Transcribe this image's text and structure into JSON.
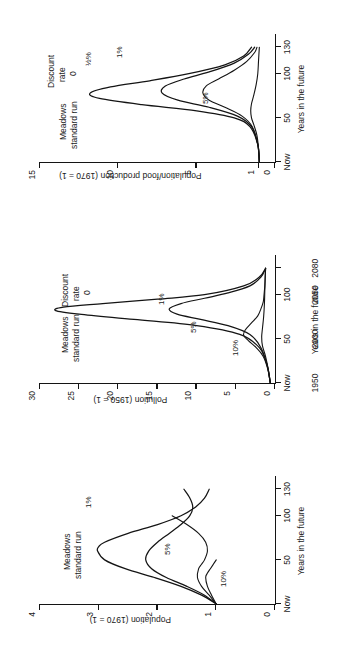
{
  "figure": {
    "shared": {
      "scenario_note_line1": "Meadows",
      "scenario_note_line2": "standard run",
      "legend_line1": "Discount",
      "legend_line2": "rate",
      "legend_line3": "0",
      "xlabel": "Years in the future"
    }
  },
  "chart_data": [
    {
      "id": "population",
      "type": "line",
      "title": "",
      "ylabel": "Population (1970 = 1)",
      "xlabel": "Years in the future",
      "xlim": [
        0,
        145
      ],
      "ylim": [
        0,
        4
      ],
      "yticks": [
        0,
        1,
        2,
        3,
        4
      ],
      "ytick_labels": [
        "0",
        "1",
        "2",
        "3",
        "4"
      ],
      "xticks": [
        0,
        50,
        100,
        130
      ],
      "xtick_labels": [
        "Now",
        "50",
        "100",
        "130"
      ],
      "grid": false,
      "legend_position": "inside-upper-right",
      "annotations": [
        "Meadows standard run",
        "1%",
        "5%",
        "10%"
      ],
      "series": [
        {
          "name": "Discount rate 0",
          "label": "Meadows standard run",
          "x": [
            0,
            10,
            20,
            30,
            40,
            50,
            60,
            65,
            70,
            80,
            90,
            100,
            110,
            120,
            130
          ],
          "values": [
            1.0,
            1.25,
            1.6,
            2.05,
            2.55,
            2.9,
            3.02,
            3.0,
            2.9,
            2.5,
            2.0,
            1.6,
            1.35,
            1.2,
            1.12
          ]
        },
        {
          "name": "1%",
          "label": "1%",
          "x": [
            0,
            10,
            20,
            30,
            40,
            50,
            60,
            70,
            80,
            90,
            100,
            110,
            120,
            130
          ],
          "values": [
            1.0,
            1.2,
            1.5,
            1.85,
            2.1,
            2.2,
            2.15,
            2.0,
            1.8,
            1.6,
            1.45,
            1.4,
            1.45,
            1.55
          ]
        },
        {
          "name": "5%",
          "label": "5%",
          "x": [
            0,
            10,
            20,
            30,
            40,
            45,
            50,
            60,
            70,
            80,
            90,
            100
          ],
          "values": [
            1.0,
            1.12,
            1.25,
            1.32,
            1.3,
            1.25,
            1.2,
            1.15,
            1.18,
            1.3,
            1.5,
            1.75
          ]
        },
        {
          "name": "10%",
          "label": "10%",
          "x": [
            0,
            10,
            20,
            30,
            35,
            40,
            45,
            50
          ],
          "values": [
            1.0,
            1.08,
            1.15,
            1.18,
            1.15,
            1.1,
            1.05,
            1.0
          ]
        }
      ]
    },
    {
      "id": "pollution",
      "type": "line",
      "title": "",
      "ylabel": "Pollution (1950 = 1)",
      "xlabel": "Years in the future",
      "xlim": [
        0,
        145
      ],
      "ylim": [
        0,
        30
      ],
      "yticks": [
        0,
        5,
        10,
        15,
        20,
        25,
        30
      ],
      "ytick_labels": [
        "0",
        "5",
        "10",
        "15",
        "20",
        "25",
        "30"
      ],
      "xticks": [
        0,
        50,
        100,
        130
      ],
      "xtick_labels": [
        "Now",
        "50",
        "100",
        "130"
      ],
      "x_secondary_labels": [
        "1950",
        "2000",
        "2050",
        "2080"
      ],
      "grid": false,
      "legend_position": "inside-upper-right",
      "annotations": [
        "Meadows standard run",
        "Discount rate 0",
        "1%",
        "5%",
        "10%"
      ],
      "series": [
        {
          "name": "Discount rate 0",
          "label": "Meadows standard run",
          "x": [
            0,
            20,
            40,
            55,
            65,
            72,
            78,
            82,
            86,
            90,
            95,
            100,
            110,
            120,
            130
          ],
          "values": [
            0.6,
            1.0,
            2.0,
            4.5,
            10.0,
            18.0,
            25.0,
            28.0,
            27.0,
            22.0,
            15.0,
            9.0,
            4.0,
            2.0,
            1.2
          ]
        },
        {
          "name": "1%",
          "label": "1%",
          "x": [
            0,
            20,
            40,
            55,
            65,
            72,
            78,
            84,
            90,
            96,
            102,
            110,
            120,
            130
          ],
          "values": [
            0.6,
            1.0,
            1.8,
            3.2,
            6.0,
            9.5,
            12.5,
            13.5,
            12.0,
            9.0,
            6.0,
            3.2,
            1.8,
            1.2
          ]
        },
        {
          "name": "5%",
          "label": "5%",
          "x": [
            0,
            15,
            30,
            40,
            48,
            54,
            60,
            68,
            76,
            84,
            92,
            100,
            110,
            120,
            130
          ],
          "values": [
            0.6,
            0.9,
            1.5,
            2.4,
            3.4,
            4.0,
            3.8,
            3.0,
            2.2,
            1.8,
            1.5,
            1.4,
            1.3,
            1.25,
            1.2
          ]
        },
        {
          "name": "10%",
          "label": "10%",
          "x": [
            0,
            15,
            30,
            42,
            52,
            62,
            75,
            90,
            105,
            120,
            130
          ],
          "values": [
            0.6,
            0.85,
            1.2,
            1.6,
            1.7,
            1.6,
            1.45,
            1.35,
            1.3,
            1.25,
            1.2
          ]
        }
      ]
    },
    {
      "id": "population-food",
      "type": "line",
      "title": "",
      "ylabel": "Population/food production (1970 = 1)",
      "xlabel": "Years in the future",
      "xlim": [
        0,
        145
      ],
      "ylim": [
        0,
        15
      ],
      "yticks": [
        0,
        1,
        5,
        10,
        15
      ],
      "ytick_labels": [
        "0",
        "1",
        "5",
        "10",
        "15"
      ],
      "xticks": [
        0,
        50,
        100,
        130
      ],
      "xtick_labels": [
        "Now",
        "50",
        "100",
        "130"
      ],
      "grid": false,
      "legend_position": "inside-upper-right",
      "annotations": [
        "Meadows standard run",
        "Discount rate 0",
        "½%",
        "1%",
        "5%"
      ],
      "series": [
        {
          "name": "Discount rate 0",
          "label": "Meadows standard run",
          "x": [
            0,
            20,
            40,
            50,
            58,
            65,
            72,
            78,
            85,
            92,
            100,
            110,
            120,
            130
          ],
          "values": [
            1.0,
            1.1,
            1.6,
            2.6,
            5.0,
            8.5,
            11.2,
            11.8,
            10.5,
            8.0,
            5.5,
            3.2,
            2.0,
            1.5
          ]
        },
        {
          "name": "½%",
          "label": "½%",
          "x": [
            0,
            20,
            40,
            52,
            62,
            70,
            78,
            86,
            94,
            102,
            112,
            122,
            130
          ],
          "values": [
            1.0,
            1.1,
            1.5,
            2.4,
            4.2,
            6.2,
            7.2,
            7.0,
            5.8,
            4.2,
            2.6,
            1.7,
            1.3
          ]
        },
        {
          "name": "1%",
          "label": "1%",
          "x": [
            0,
            20,
            40,
            52,
            62,
            70,
            78,
            86,
            94,
            104,
            114,
            124,
            130
          ],
          "values": [
            1.0,
            1.1,
            1.45,
            2.1,
            3.2,
            4.2,
            4.6,
            4.4,
            3.6,
            2.6,
            1.8,
            1.3,
            1.15
          ]
        },
        {
          "name": "5%",
          "label": "5%",
          "x": [
            0,
            15,
            30,
            42,
            50,
            58,
            66,
            76,
            88,
            100,
            115,
            130
          ],
          "values": [
            1.0,
            1.05,
            1.15,
            1.35,
            1.5,
            1.55,
            1.5,
            1.35,
            1.2,
            1.1,
            1.05,
            1.0
          ]
        }
      ]
    }
  ]
}
